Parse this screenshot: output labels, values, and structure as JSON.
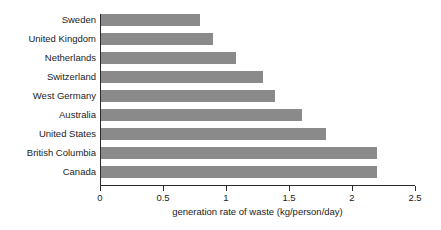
{
  "chart_data": {
    "type": "bar",
    "orientation": "horizontal",
    "title": "",
    "xlabel": "generation rate of waste (kg/person/day)",
    "ylabel": "",
    "categories": [
      "Sweden",
      "United Kingdom",
      "Netherlands",
      "Switzerland",
      "West Germany",
      "Australia",
      "United States",
      "British Columbia",
      "Canada"
    ],
    "values": [
      0.79,
      0.9,
      1.08,
      1.29,
      1.39,
      1.6,
      1.79,
      2.2,
      2.2
    ],
    "xlim": [
      0,
      2.5
    ],
    "xticks": [
      0,
      0.5,
      1,
      1.5,
      2,
      2.5
    ],
    "xtick_labels": [
      "0",
      "0.5",
      "1",
      "1.5",
      "2",
      "2.5"
    ],
    "grid": false,
    "legend": null,
    "bar_color": "#8a8a8a",
    "axis_color": "#2b2b2b",
    "background": "#ffffff"
  }
}
